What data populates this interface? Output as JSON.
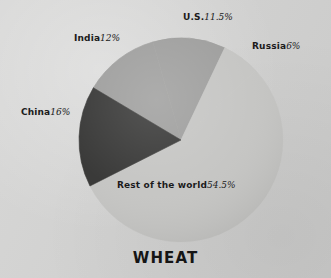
{
  "chart_data": {
    "type": "pie",
    "title": "WHEAT",
    "subtitle": "",
    "xlabel": "",
    "ylabel": "",
    "legend_position": "none",
    "labels_inline": true,
    "unit": "%",
    "total": 100,
    "categories": [
      "India",
      "U.S.",
      "Russia",
      "Rest of the world",
      "China"
    ],
    "values": [
      12,
      11.5,
      6,
      54.5,
      16
    ],
    "slices": [
      {
        "name": "India",
        "label": "India",
        "value": 12,
        "value_text": "12%",
        "color": "#9c9c9b",
        "start_angle": 300.8,
        "end_angle": 344.0
      },
      {
        "name": "U.S.",
        "label": "U.S.",
        "value": 11.5,
        "value_text": "11.5%",
        "color": "#9c9c9b",
        "start_angle": 344.0,
        "end_angle": 385.4
      },
      {
        "name": "Russia",
        "label": "Russia",
        "value": 6,
        "value_text": "6%",
        "color": "#c4c4c2",
        "start_angle": 385.4,
        "end_angle": 407.0
      },
      {
        "name": "Rest of the world",
        "label": "Rest of the world",
        "value": 54.5,
        "value_text": "54.5%",
        "color": "#c4c4c2",
        "start_angle": 407.0,
        "end_angle": 603.2
      },
      {
        "name": "China",
        "label": "China",
        "value": 16,
        "value_text": "16%",
        "color": "#343433",
        "start_angle": 603.2,
        "end_angle": 660.8
      }
    ],
    "colors": {
      "background": "#d3d3d2",
      "slice_medium_gray": "#9c9c9b",
      "slice_light_gray": "#c4c4c2",
      "slice_dark": "#343433",
      "text": "#1b1b1b"
    },
    "geometry": {
      "center_x": 181,
      "center_y": 140,
      "radius": 102
    }
  },
  "labels": {
    "us": {
      "name": "U.S.",
      "pct": "11.5%"
    },
    "russia": {
      "name": "Russia",
      "pct": "6%"
    },
    "india": {
      "name": "India",
      "pct": "12%"
    },
    "china": {
      "name": "China",
      "pct": "16%"
    },
    "rest": {
      "name": "Rest of the world",
      "pct": "54.5%"
    }
  },
  "title": "WHEAT"
}
